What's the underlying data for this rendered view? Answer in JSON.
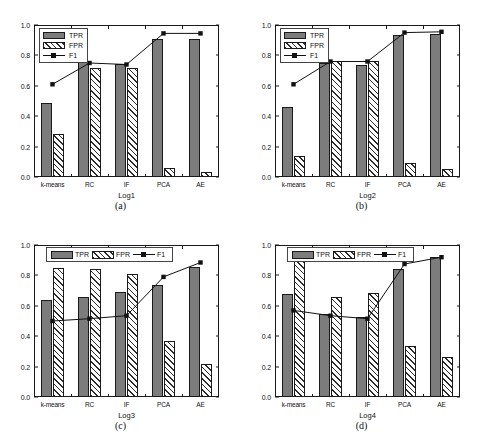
{
  "figure": {
    "yticks": [
      "0.0",
      "0.2",
      "0.4",
      "0.6",
      "0.8",
      "1.0"
    ],
    "legend": {
      "tpr": "TPR",
      "fpr": "FPR",
      "f1": "F1"
    },
    "colors": {
      "tpr_fill": "#7c7c7c",
      "hatch": "#2a2a2a",
      "line": "#111111",
      "axis": "#1a1a1a"
    }
  },
  "panels": [
    {
      "caption": "(a)",
      "xlabel": "Log1",
      "legend_style": "vertical"
    },
    {
      "caption": "(b)",
      "xlabel": "Log2",
      "legend_style": "vertical"
    },
    {
      "caption": "(c)",
      "xlabel": "Log3",
      "legend_style": "horizontal"
    },
    {
      "caption": "(d)",
      "xlabel": "Log4",
      "legend_style": "horizontal"
    }
  ],
  "chart_data": [
    {
      "type": "bar",
      "title": "(a)",
      "xlabel": "Log1",
      "ylabel": "",
      "ylim": [
        0.0,
        1.0
      ],
      "yticks": [
        0.0,
        0.2,
        0.4,
        0.6,
        0.8,
        1.0
      ],
      "grid": false,
      "legend_position": "top-left",
      "categories": [
        "k-means",
        "RC",
        "IF",
        "PCA",
        "AE"
      ],
      "series": [
        {
          "name": "TPR",
          "type": "bar",
          "values": [
            0.49,
            0.765,
            0.745,
            0.905,
            0.91
          ]
        },
        {
          "name": "FPR",
          "type": "bar",
          "values": [
            0.285,
            0.72,
            0.72,
            0.06,
            0.035
          ]
        },
        {
          "name": "F1",
          "type": "line",
          "values": [
            0.61,
            0.75,
            0.74,
            0.945,
            0.945
          ]
        }
      ]
    },
    {
      "type": "bar",
      "title": "(b)",
      "xlabel": "Log2",
      "ylabel": "",
      "ylim": [
        0.0,
        1.0
      ],
      "yticks": [
        0.0,
        0.2,
        0.4,
        0.6,
        0.8,
        1.0
      ],
      "grid": false,
      "legend_position": "top-left",
      "categories": [
        "k-means",
        "RC",
        "IF",
        "PCA",
        "AE"
      ],
      "series": [
        {
          "name": "TPR",
          "type": "bar",
          "values": [
            0.46,
            0.75,
            0.74,
            0.935,
            0.94
          ]
        },
        {
          "name": "FPR",
          "type": "bar",
          "values": [
            0.135,
            0.76,
            0.76,
            0.09,
            0.055
          ]
        },
        {
          "name": "F1",
          "type": "line",
          "values": [
            0.61,
            0.76,
            0.76,
            0.95,
            0.955
          ]
        }
      ]
    },
    {
      "type": "bar",
      "title": "(c)",
      "xlabel": "Log3",
      "ylabel": "",
      "ylim": [
        0.0,
        1.0
      ],
      "yticks": [
        0.0,
        0.2,
        0.4,
        0.6,
        0.8,
        1.0
      ],
      "grid": false,
      "legend_position": "top-center",
      "categories": [
        "k-means",
        "RC",
        "IF",
        "PCA",
        "AE"
      ],
      "series": [
        {
          "name": "TPR",
          "type": "bar",
          "values": [
            0.635,
            0.66,
            0.69,
            0.74,
            0.855
          ]
        },
        {
          "name": "FPR",
          "type": "bar",
          "values": [
            0.85,
            0.84,
            0.81,
            0.37,
            0.22
          ]
        },
        {
          "name": "F1",
          "type": "line",
          "values": [
            0.5,
            0.515,
            0.535,
            0.79,
            0.885
          ]
        }
      ]
    },
    {
      "type": "bar",
      "title": "(d)",
      "xlabel": "Log4",
      "ylabel": "",
      "ylim": [
        0.0,
        1.0
      ],
      "yticks": [
        0.0,
        0.2,
        0.4,
        0.6,
        0.8,
        1.0
      ],
      "grid": false,
      "legend_position": "top-center",
      "categories": [
        "k-means",
        "RC",
        "IF",
        "PCA",
        "AE"
      ],
      "series": [
        {
          "name": "TPR",
          "type": "bar",
          "values": [
            0.675,
            0.545,
            0.525,
            0.845,
            0.92
          ]
        },
        {
          "name": "FPR",
          "type": "bar",
          "values": [
            0.935,
            0.66,
            0.685,
            0.335,
            0.265
          ]
        },
        {
          "name": "F1",
          "type": "line",
          "values": [
            0.57,
            0.535,
            0.515,
            0.875,
            0.92
          ]
        }
      ]
    }
  ]
}
